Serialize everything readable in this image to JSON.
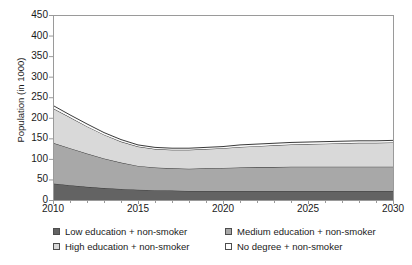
{
  "chart_data": {
    "type": "area",
    "stacked": true,
    "title": "",
    "xlabel": "",
    "ylabel": "Population (in 1000)",
    "xlim": [
      2010,
      2030
    ],
    "ylim": [
      0,
      450
    ],
    "yticks": [
      0,
      50,
      100,
      150,
      200,
      250,
      300,
      350,
      400,
      450
    ],
    "ytick_labels": [
      "0",
      "50",
      "100",
      "150",
      "200",
      "250",
      "300",
      "350",
      "400",
      "450"
    ],
    "xticks": [
      2010,
      2015,
      2020,
      2025,
      2030
    ],
    "xtick_labels": [
      "2010",
      "2015",
      "2020",
      "2025",
      "2030"
    ],
    "x_minor_tick_step": 1,
    "grid": false,
    "legend_position": "below",
    "x": [
      2010,
      2011,
      2012,
      2013,
      2014,
      2015,
      2016,
      2017,
      2018,
      2019,
      2020,
      2021,
      2022,
      2023,
      2024,
      2025,
      2026,
      2027,
      2028,
      2029,
      2030
    ],
    "series": [
      {
        "name": "Low education + non-smoker",
        "color": "#636363",
        "values": [
          40,
          36,
          32,
          29,
          27,
          25,
          24,
          23,
          22,
          22,
          22,
          22,
          22,
          22,
          22,
          22,
          22,
          22,
          22,
          22,
          22
        ]
      },
      {
        "name": "Medium education + non-smoker",
        "color": "#a8a8a8",
        "values": [
          99,
          90,
          81,
          72,
          64,
          58,
          55,
          54,
          54,
          55,
          56,
          57,
          58,
          58,
          59,
          59,
          59,
          59,
          59,
          59,
          59
        ]
      },
      {
        "name": "High education + non-smoker",
        "color": "#d9d9d9",
        "values": [
          84,
          75,
          66,
          58,
          51,
          47,
          45,
          45,
          46,
          47,
          48,
          50,
          51,
          53,
          54,
          55,
          56,
          57,
          58,
          58,
          59
        ]
      },
      {
        "name": "No degree + non-smoker",
        "color": "#fbfbfb",
        "values": [
          7,
          6,
          6,
          5,
          5,
          4,
          4,
          4,
          4,
          4,
          4,
          5,
          5,
          5,
          5,
          5,
          5,
          5,
          5,
          5,
          5
        ]
      }
    ],
    "totals": [
      230,
      207,
      185,
      164,
      147,
      134,
      128,
      126,
      126,
      128,
      130,
      134,
      136,
      138,
      140,
      141,
      142,
      143,
      144,
      144,
      145
    ],
    "line_color": "#3a3a3a",
    "axis_color": "#9a9a9a"
  },
  "legend": {
    "items": [
      {
        "label": "Low education + non-smoker",
        "color": "#636363"
      },
      {
        "label": "Medium education + non-smoker",
        "color": "#a8a8a8"
      },
      {
        "label": "High education + non-smoker",
        "color": "#d9d9d9"
      },
      {
        "label": "No degree + non-smoker",
        "color": "#fdfdfd"
      }
    ]
  }
}
